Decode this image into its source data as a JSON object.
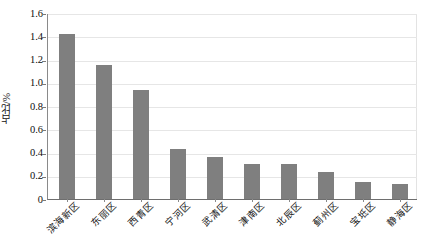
{
  "chart_data": {
    "type": "bar",
    "title": "",
    "subtitle": "",
    "xlabel": "",
    "ylabel": "占比/%",
    "categories": [
      "滨海新区",
      "东丽区",
      "西青区",
      "宁河区",
      "武清区",
      "津南区",
      "北辰区",
      "蓟州区",
      "宝坻区",
      "静海区"
    ],
    "values": [
      1.42,
      1.15,
      0.94,
      0.43,
      0.36,
      0.3,
      0.3,
      0.23,
      0.15,
      0.13
    ],
    "series": [
      {
        "name": "占比/%",
        "values": [
          1.42,
          1.15,
          0.94,
          0.43,
          0.36,
          0.3,
          0.3,
          0.23,
          0.15,
          0.13
        ]
      }
    ],
    "ylim": [
      0,
      1.6
    ],
    "ytick_labels": [
      "0",
      "0.2",
      "0.4",
      "0.6",
      "0.8",
      "1.0",
      "1.2",
      "1.4",
      "1.6"
    ],
    "ytick_values": [
      0,
      0.2,
      0.4,
      0.6,
      0.8,
      1.0,
      1.2,
      1.4,
      1.6
    ],
    "grid": true,
    "legend": false,
    "legend_position": "none",
    "bar_color": "#7f7f7f",
    "gridline_color": "#e6e6e6",
    "axis_color": "#8a8a8a",
    "background_color": "#ffffff",
    "xlabel_rotation": -45
  }
}
